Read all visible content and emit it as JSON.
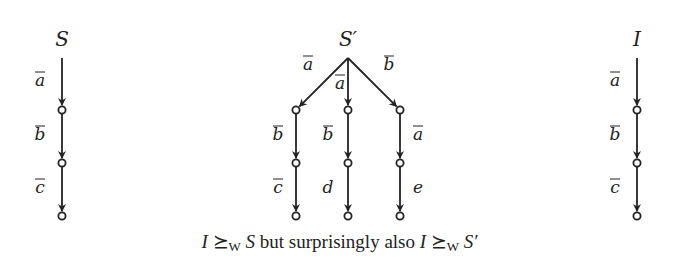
{
  "figure": {
    "trees": [
      {
        "id": "S",
        "label": "S",
        "root": [
          62,
          58
        ],
        "edges": [
          {
            "from": [
              62,
              58
            ],
            "to": [
              62,
              110
            ],
            "label": "a",
            "overline": true,
            "label_pos": [
              40,
              86
            ]
          },
          {
            "from": [
              62,
              110
            ],
            "to": [
              62,
              163
            ],
            "label": "b",
            "overline": true,
            "label_pos": [
              40,
              140
            ]
          },
          {
            "from": [
              62,
              163
            ],
            "to": [
              62,
              216
            ],
            "label": "c",
            "overline": true,
            "label_pos": [
              40,
              193
            ]
          }
        ],
        "nodes": [
          [
            62,
            110
          ],
          [
            62,
            163
          ],
          [
            62,
            216
          ]
        ]
      },
      {
        "id": "S-prime",
        "label": "S′",
        "root": [
          348,
          58
        ],
        "edges": [
          {
            "from": [
              348,
              58
            ],
            "to": [
              296,
              110
            ],
            "label": "a",
            "overline": true,
            "label_pos": [
              308,
              70
            ]
          },
          {
            "from": [
              348,
              58
            ],
            "to": [
              348,
              110
            ],
            "label": "a",
            "overline": true,
            "label_pos": [
              340,
              89
            ]
          },
          {
            "from": [
              348,
              58
            ],
            "to": [
              400,
              110
            ],
            "label": "b",
            "overline": true,
            "label_pos": [
              389,
              70
            ]
          },
          {
            "from": [
              296,
              110
            ],
            "to": [
              296,
              163
            ],
            "label": "b",
            "overline": true,
            "label_pos": [
              278,
              140
            ]
          },
          {
            "from": [
              348,
              110
            ],
            "to": [
              348,
              163
            ],
            "label": "b",
            "overline": true,
            "label_pos": [
              328,
              140
            ]
          },
          {
            "from": [
              400,
              110
            ],
            "to": [
              400,
              163
            ],
            "label": "a",
            "overline": true,
            "label_pos": [
              418,
              140
            ]
          },
          {
            "from": [
              296,
              163
            ],
            "to": [
              296,
              216
            ],
            "label": "c",
            "overline": true,
            "label_pos": [
              278,
              193
            ]
          },
          {
            "from": [
              348,
              163
            ],
            "to": [
              348,
              216
            ],
            "label": "d",
            "overline": false,
            "label_pos": [
              328,
              193
            ]
          },
          {
            "from": [
              400,
              163
            ],
            "to": [
              400,
              216
            ],
            "label": "e",
            "overline": false,
            "label_pos": [
              418,
              193
            ]
          }
        ],
        "nodes": [
          [
            296,
            110
          ],
          [
            348,
            110
          ],
          [
            400,
            110
          ],
          [
            296,
            163
          ],
          [
            348,
            163
          ],
          [
            400,
            163
          ],
          [
            296,
            216
          ],
          [
            348,
            216
          ],
          [
            400,
            216
          ]
        ]
      },
      {
        "id": "I",
        "label": "I",
        "root": [
          637,
          58
        ],
        "edges": [
          {
            "from": [
              637,
              58
            ],
            "to": [
              637,
              110
            ],
            "label": "a",
            "overline": true,
            "label_pos": [
              615,
              86
            ]
          },
          {
            "from": [
              637,
              110
            ],
            "to": [
              637,
              163
            ],
            "label": "b",
            "overline": true,
            "label_pos": [
              615,
              140
            ]
          },
          {
            "from": [
              637,
              163
            ],
            "to": [
              637,
              216
            ],
            "label": "c",
            "overline": true,
            "label_pos": [
              615,
              193
            ]
          }
        ],
        "nodes": [
          [
            637,
            110
          ],
          [
            637,
            163
          ],
          [
            637,
            216
          ]
        ]
      }
    ],
    "root_labels": [
      {
        "text": "S",
        "pos": [
          62,
          46
        ]
      },
      {
        "text": "S′",
        "pos": [
          348,
          46
        ]
      },
      {
        "text": "I",
        "pos": [
          637,
          46
        ]
      }
    ],
    "caption": {
      "part1_var": "I",
      "relation": "⪰",
      "relation_sub": "W",
      "part1_rhs": "S",
      "middle_text": " but surprisingly also ",
      "part2_var": "I",
      "part2_rhs": "S′"
    }
  }
}
